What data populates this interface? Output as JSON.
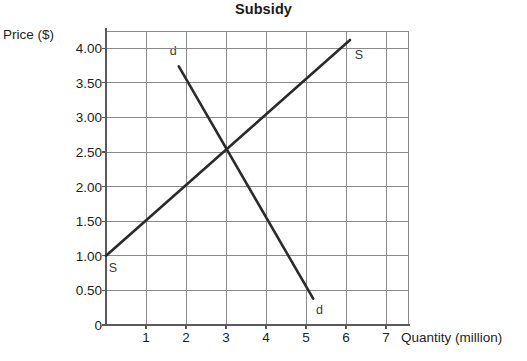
{
  "chart_data": {
    "type": "line",
    "title": "Subsidy",
    "xlabel": "Quantity (million)",
    "ylabel": "Price ($)",
    "xlim": [
      0,
      7.55
    ],
    "ylim": [
      0,
      4.25
    ],
    "grid": true,
    "legend_position": "inline-endpoint-labels",
    "x_ticks": [
      "1",
      "2",
      "3",
      "4",
      "5",
      "6",
      "7"
    ],
    "x_tick_values": [
      1,
      2,
      3,
      4,
      5,
      6,
      7
    ],
    "y_ticks": [
      "0",
      "0.50",
      "1.00",
      "1.50",
      "2.00",
      "2.50",
      "3.00",
      "3.50",
      "4.00"
    ],
    "y_tick_values": [
      0,
      0.5,
      1.0,
      1.5,
      2.0,
      2.5,
      3.0,
      3.5,
      4.0
    ],
    "series": [
      {
        "name": "S",
        "label": "S",
        "role": "supply",
        "color": "#2b2b2b",
        "x": [
          0,
          6.1
        ],
        "y": [
          1.0,
          4.12
        ],
        "start_label": {
          "text": "S",
          "x": 0.17,
          "y": 0.82
        },
        "end_label": {
          "text": "S",
          "x": 6.32,
          "y": 3.9
        }
      },
      {
        "name": "d",
        "label": "d",
        "role": "demand",
        "color": "#2b2b2b",
        "x": [
          1.82,
          5.18
        ],
        "y": [
          3.74,
          0.38
        ],
        "start_label": {
          "text": "d",
          "x": 1.68,
          "y": 3.96
        },
        "end_label": {
          "text": "d",
          "x": 5.34,
          "y": 0.21
        }
      }
    ],
    "annotations": [
      {
        "text": "equilibrium",
        "x": 3,
        "y": 2.5,
        "visible": false
      }
    ],
    "equilibrium": {
      "quantity": 3,
      "price": 2.5
    }
  },
  "axes": {
    "title": "Subsidy",
    "y_axis_title": "Price ($)",
    "x_axis_title": "Quantity (million)"
  }
}
